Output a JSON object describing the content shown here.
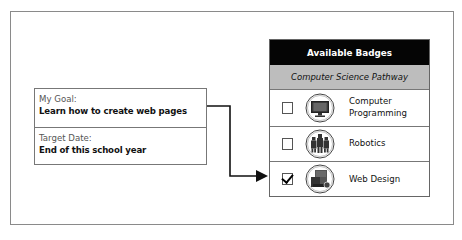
{
  "goal": {
    "goal_label": "My Goal:",
    "goal_value": "Learn how to create web pages",
    "date_label": "Target Date:",
    "date_value": "End of this school year"
  },
  "badges_panel": {
    "title": "Available Badges",
    "pathway": "Computer Science Pathway",
    "items": [
      {
        "label_line1": "Computer",
        "label_line2": "Programming",
        "icon": "computer-monitor-icon",
        "checked": false
      },
      {
        "label_line1": "Robotics",
        "label_line2": "",
        "icon": "robots-icon",
        "checked": false
      },
      {
        "label_line1": "Web Design",
        "label_line2": "",
        "icon": "web-design-icon",
        "checked": true
      }
    ]
  },
  "connector": {
    "from": "goal",
    "to": "Web Design",
    "color": "#111111"
  },
  "colors": {
    "header_bg": "#050505",
    "subheader_bg": "#bdbdbd",
    "border": "#777777"
  }
}
